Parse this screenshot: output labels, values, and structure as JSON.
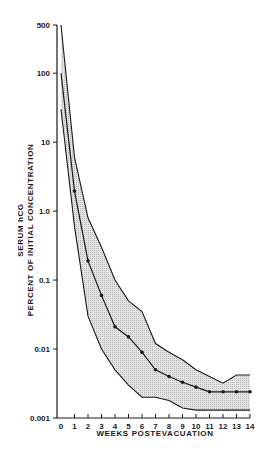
{
  "chart_data": {
    "type": "line",
    "title": "",
    "xlabel": "WEEKS POSTEVACUATION",
    "ylabel_line1": "SERUM hCG",
    "ylabel_line2": "PERCENT OF INITIAL CONCENTRATION",
    "yscale": "log",
    "ylim": [
      0.001,
      500
    ],
    "xlim": [
      0,
      14
    ],
    "grid": false,
    "legend": null,
    "x": [
      0,
      1,
      2,
      3,
      4,
      5,
      6,
      7,
      8,
      9,
      10,
      11,
      12,
      13,
      14
    ],
    "x_tick_labels": [
      "0",
      "1",
      "2",
      "3",
      "4",
      "5",
      "6",
      "7",
      "8",
      "9",
      "10",
      "11",
      "12",
      "13",
      "14"
    ],
    "y_ticks": [
      500,
      100,
      10,
      1.0,
      0.1,
      0.01,
      0.001
    ],
    "y_tick_labels": [
      "500",
      "100",
      "10",
      "1.0",
      "0.1",
      "0.01",
      "0.001"
    ],
    "series": [
      {
        "name": "mean",
        "style": "line-with-markers",
        "values": [
          100,
          1.95,
          0.19,
          0.06,
          0.021,
          0.015,
          0.009,
          0.005,
          0.004,
          0.0033,
          0.0028,
          0.0024,
          0.0024,
          0.0024,
          0.0024
        ]
      },
      {
        "name": "upper bound",
        "style": "band-edge",
        "values": [
          500,
          6,
          0.8,
          0.3,
          0.1,
          0.05,
          0.035,
          0.012,
          0.009,
          0.007,
          0.005,
          0.004,
          0.0032,
          0.0042,
          0.0042
        ]
      },
      {
        "name": "lower bound",
        "style": "band-edge",
        "values": [
          30,
          0.6,
          0.03,
          0.01,
          0.005,
          0.003,
          0.002,
          0.002,
          0.0018,
          0.0014,
          0.0013,
          0.0013,
          0.0013,
          0.0013,
          0.0013
        ]
      }
    ],
    "band_fill": "#d9d9d9",
    "line_color": "#1a1a1a"
  }
}
